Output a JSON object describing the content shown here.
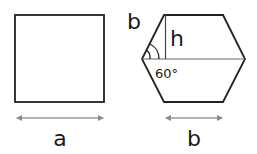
{
  "diagram": {
    "square": {
      "side_label": "a"
    },
    "hexagon": {
      "side_label_top": "b",
      "height_label": "h",
      "angle_label": "60°",
      "side_label_bottom": "b"
    },
    "colors": {
      "stroke": "#222222",
      "arrow": "#8a8a8a",
      "angle_arc": "#222222"
    }
  }
}
